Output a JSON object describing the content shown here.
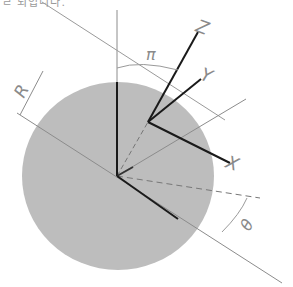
{
  "header": {
    "cut_text": "ㄹ 되입니다."
  },
  "diagram": {
    "labels": {
      "z_axis": "Z",
      "y_axis": "Y",
      "x_axis": "X",
      "radius": "R",
      "pi_angle": "π",
      "theta_angle": "θ"
    },
    "colors": {
      "disk": "#b9b9b9",
      "axes": "#1a1a1a",
      "guide_lines": "#8c8c8c",
      "labels": "#8a8a8a"
    }
  }
}
